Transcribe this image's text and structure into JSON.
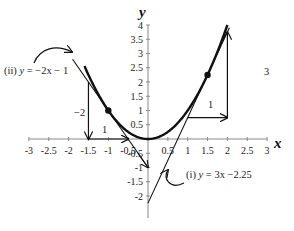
{
  "axes": {
    "x_title": "x",
    "y_title": "y",
    "x_ticks": [
      "-3",
      "-2.5",
      "-2",
      "-1.5",
      "-1",
      "-0.5",
      "0.5",
      "1",
      "1.5",
      "2",
      "2.5",
      "3"
    ],
    "x_tick_values": [
      -3,
      -2.5,
      -2,
      -1.5,
      -1,
      -0.5,
      0.5,
      1,
      1.5,
      2,
      2.5,
      3
    ],
    "y_ticks_pos": [
      "0.5",
      "1",
      "1.5",
      "2",
      "2.5",
      "3",
      "3.5",
      "4"
    ],
    "y_tick_pos_values": [
      0.5,
      1,
      1.5,
      2,
      2.5,
      3,
      3.5,
      4
    ],
    "y_ticks_neg": [
      "-0.5",
      "-1",
      "-1.5",
      "-2"
    ],
    "y_tick_neg_values": [
      -0.5,
      -1,
      -1.5,
      -2
    ]
  },
  "curve": {
    "name": "parabola",
    "equation": "y = x^2",
    "x_range": [
      -1.6,
      2.0
    ]
  },
  "tangents": [
    {
      "id": "i",
      "label_prefix": "(i) ",
      "label_y": "y",
      "label_rest": " = 3x −2.25",
      "slope": 3,
      "intercept": -2.25,
      "point": [
        1.5,
        2.25
      ],
      "rise_label": "3",
      "run_label": "1"
    },
    {
      "id": "ii",
      "label_prefix": "(ii) ",
      "label_y": "y",
      "label_rest": " = −2x − 1",
      "slope": -2,
      "intercept": -1,
      "point": [
        -1,
        1
      ],
      "rise_label": "−2",
      "run_label": "1"
    }
  ],
  "colors": {
    "ink": "#111111",
    "axis": "#888888",
    "text": "#222222"
  }
}
